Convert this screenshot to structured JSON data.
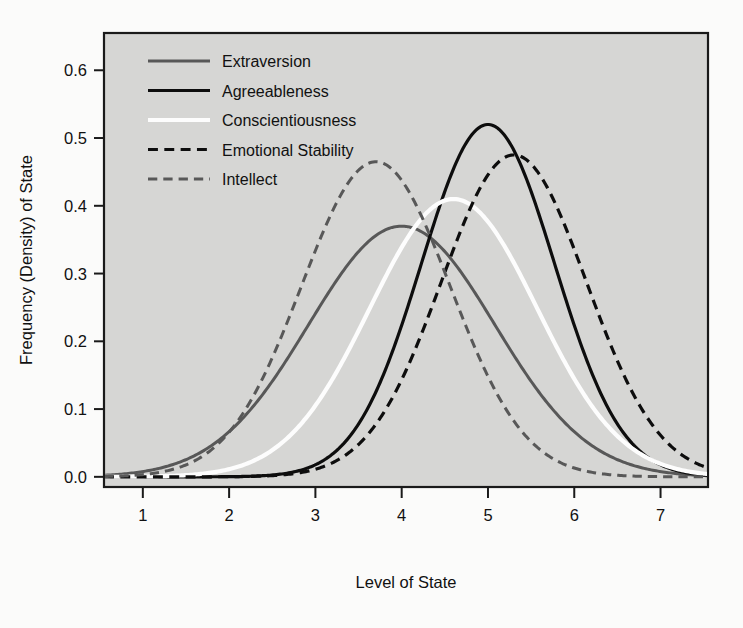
{
  "figure": {
    "background_color": "#fbfbfa",
    "plot_background_color": "#d6d6d4",
    "frame_color": "#1a1a1a"
  },
  "chart_data": {
    "type": "line",
    "title": "",
    "subtitle": "",
    "xlabel": "Level of State",
    "ylabel": "Frequency (Density) of State",
    "xlim": [
      0.55,
      7.55
    ],
    "ylim": [
      -0.015,
      0.655
    ],
    "xticks": [
      1,
      2,
      3,
      4,
      5,
      6,
      7
    ],
    "xtick_labels": [
      "1",
      "2",
      "3",
      "4",
      "5",
      "6",
      "7"
    ],
    "yticks": [
      0.0,
      0.1,
      0.2,
      0.3,
      0.4,
      0.5,
      0.6
    ],
    "ytick_labels": [
      "0.0",
      "0.1",
      "0.2",
      "0.3",
      "0.4",
      "0.5",
      "0.6"
    ],
    "grid": false,
    "legend_position": "top-left",
    "series": [
      {
        "name": "Extraversion",
        "color": "#585858",
        "dash": "solid",
        "width": 3.0,
        "mean": 4.0,
        "sd": 1.08,
        "peak": 0.37,
        "x": [
          1.0,
          1.5,
          2.0,
          2.5,
          3.0,
          3.5,
          4.0,
          4.5,
          5.0,
          5.5,
          6.0,
          6.5,
          7.0,
          7.4
        ],
        "y": [
          0.013,
          0.029,
          0.057,
          0.1,
          0.159,
          0.229,
          0.296,
          0.345,
          0.37,
          0.345,
          0.296,
          0.229,
          0.159,
          0.11
        ]
      },
      {
        "name": "Agreeableness",
        "color": "#0d0d0d",
        "dash": "solid",
        "width": 3.2,
        "mean": 5.0,
        "sd": 0.77,
        "peak": 0.52,
        "x": [
          1.0,
          1.5,
          2.0,
          2.5,
          3.0,
          3.5,
          4.0,
          4.5,
          5.0,
          5.5,
          6.0,
          6.5,
          7.0,
          7.4
        ],
        "y": [
          0.0,
          0.0,
          0.001,
          0.005,
          0.021,
          0.069,
          0.175,
          0.354,
          0.52,
          0.447,
          0.28,
          0.14,
          0.055,
          0.019
        ]
      },
      {
        "name": "Conscientiousness",
        "color": "#fdfdfd",
        "dash": "solid",
        "width": 4.2,
        "mean": 4.6,
        "sd": 0.97,
        "peak": 0.41,
        "x": [
          1.0,
          1.5,
          2.0,
          2.5,
          3.0,
          3.5,
          4.0,
          4.5,
          5.0,
          5.5,
          6.0,
          6.5,
          7.0,
          7.4
        ],
        "y": [
          0.001,
          0.003,
          0.011,
          0.034,
          0.084,
          0.17,
          0.287,
          0.392,
          0.4,
          0.332,
          0.222,
          0.119,
          0.051,
          0.022
        ]
      },
      {
        "name": "Emotional Stability",
        "color": "#0d0d0d",
        "dash": "dashed",
        "width": 3.2,
        "mean": 5.3,
        "sd": 0.84,
        "peak": 0.475,
        "x": [
          1.0,
          1.5,
          2.0,
          2.5,
          3.0,
          3.5,
          4.0,
          4.5,
          5.0,
          5.5,
          6.0,
          6.5,
          7.0,
          7.4
        ],
        "y": [
          0.0,
          0.0,
          0.001,
          0.003,
          0.012,
          0.037,
          0.098,
          0.222,
          0.379,
          0.466,
          0.42,
          0.286,
          0.153,
          0.07
        ]
      },
      {
        "name": "Intellect",
        "color": "#585858",
        "dash": "dashed",
        "width": 3.0,
        "mean": 3.7,
        "sd": 0.86,
        "peak": 0.465,
        "x": [
          1.0,
          1.5,
          2.0,
          2.5,
          3.0,
          3.5,
          4.0,
          4.5,
          5.0,
          5.5,
          6.0,
          6.5,
          7.0,
          7.4
        ],
        "y": [
          0.008,
          0.029,
          0.08,
          0.18,
          0.33,
          0.44,
          0.45,
          0.355,
          0.205,
          0.092,
          0.031,
          0.008,
          0.002,
          0.0
        ]
      }
    ]
  }
}
